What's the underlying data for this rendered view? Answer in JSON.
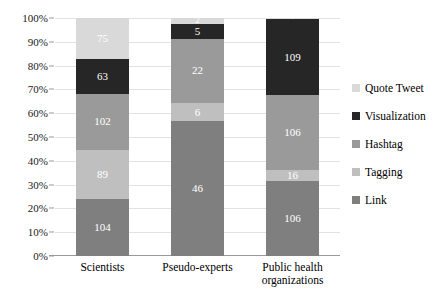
{
  "chart_data": {
    "type": "bar",
    "subtype": "stacked-100-percent",
    "title": "",
    "xlabel": "",
    "ylabel": "",
    "categories": [
      "Scientists",
      "Pseudo-experts",
      "Public health organizations"
    ],
    "category_lines": [
      [
        "Scientists"
      ],
      [
        "Pseudo-experts"
      ],
      [
        "Public health",
        "organizations"
      ]
    ],
    "series": [
      {
        "name": "Link",
        "color": "#7f7f7f",
        "values": [
          104,
          46,
          106
        ]
      },
      {
        "name": "Tagging",
        "color": "#bfbfbf",
        "values": [
          89,
          6,
          16
        ]
      },
      {
        "name": "Hashtag",
        "color": "#9a9a9a",
        "values": [
          102,
          22,
          106
        ]
      },
      {
        "name": "Visualization",
        "color": "#262626",
        "values": [
          63,
          5,
          109
        ]
      },
      {
        "name": "Quote Tweet",
        "color": "#d9d9d9",
        "values": [
          75,
          2,
          1
        ]
      }
    ],
    "stack_order_bottom_to_top": [
      "Link",
      "Tagging",
      "Hashtag",
      "Visualization",
      "Quote Tweet"
    ],
    "totals": [
      433,
      81,
      338
    ],
    "ylim": [
      0,
      100
    ],
    "yticks": [
      "0%",
      "10%",
      "20%",
      "30%",
      "40%",
      "50%",
      "60%",
      "70%",
      "80%",
      "90%",
      "100%"
    ],
    "ytick_values": [
      0,
      10,
      20,
      30,
      40,
      50,
      60,
      70,
      80,
      90,
      100
    ],
    "grid": true,
    "legend_position": "right",
    "legend_order_top_to_bottom": [
      "Quote Tweet",
      "Visualization",
      "Hashtag",
      "Tagging",
      "Link"
    ],
    "data_labels": {
      "Scientists": {
        "Link": 104,
        "Tagging": 89,
        "Hashtag": 102,
        "Visualization": 63,
        "Quote Tweet": 75
      },
      "Pseudo-experts": {
        "Link": 46,
        "Tagging": 6,
        "Hashtag": 22,
        "Visualization": 5,
        "Quote Tweet": 2
      },
      "Public health organizations": {
        "Link": 106,
        "Tagging": 16,
        "Hashtag": 106,
        "Visualization": 109,
        "Quote Tweet": 1
      }
    }
  },
  "legend": {
    "items": [
      {
        "label": "Quote Tweet",
        "color": "#d9d9d9"
      },
      {
        "label": "Visualization",
        "color": "#262626"
      },
      {
        "label": "Hashtag",
        "color": "#9a9a9a"
      },
      {
        "label": "Tagging",
        "color": "#bfbfbf"
      },
      {
        "label": "Link",
        "color": "#7f7f7f"
      }
    ]
  },
  "colors": {
    "gridline": "#e2e2e2",
    "axis": "#9a9a9a",
    "background": "#ffffff",
    "label_text": "#ffffff"
  }
}
